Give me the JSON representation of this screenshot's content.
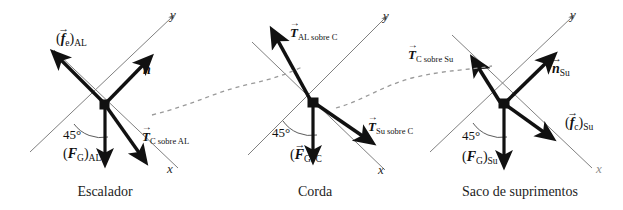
{
  "figure": {
    "kind": "free-body-diagram-set",
    "background_color": "#ffffff",
    "ink_color": "#111111",
    "axis_color": "#6e6e6e",
    "dashed_link_color": "#9a9a9a",
    "angle_value": "45°",
    "axis_x_label": "x",
    "axis_y_label": "y",
    "panels": [
      {
        "id": "escalador",
        "caption": "Escalador",
        "angle": "45°",
        "axis_x": "x",
        "axis_y": "y",
        "vectors": [
          {
            "id": "friction-climber",
            "symbol": "f",
            "arrow": "→",
            "subscript": "e",
            "group_subscript": "AL",
            "parenthesized": true,
            "direction": "up-left"
          },
          {
            "id": "normal-climber",
            "symbol": "n",
            "arrow": "→",
            "subscript": "",
            "group_subscript": "",
            "parenthesized": false,
            "direction": "up-right"
          },
          {
            "id": "tension-rope-on-climber",
            "symbol": "T",
            "arrow": "→",
            "subscript": "C sobre AL",
            "group_subscript": "",
            "parenthesized": false,
            "direction": "down-right"
          },
          {
            "id": "weight-climber",
            "symbol": "F",
            "arrow": "→",
            "subscript": "G",
            "group_subscript": "AL",
            "parenthesized": true,
            "direction": "down"
          }
        ]
      },
      {
        "id": "corda",
        "caption": "Corda",
        "angle": "45°",
        "axis_x": "x",
        "axis_y": "y",
        "vectors": [
          {
            "id": "tension-climber-on-rope",
            "symbol": "T",
            "arrow": "→",
            "subscript": "AL sobre C",
            "group_subscript": "",
            "parenthesized": false,
            "direction": "up-left"
          },
          {
            "id": "tension-bag-on-rope",
            "symbol": "T",
            "arrow": "→",
            "subscript": "Su sobre C",
            "group_subscript": "",
            "parenthesized": false,
            "direction": "down-right"
          },
          {
            "id": "weight-rope",
            "symbol": "F",
            "arrow": "→",
            "subscript": "G",
            "group_subscript": "C",
            "parenthesized": true,
            "direction": "down"
          }
        ]
      },
      {
        "id": "saco-de-suprimentos",
        "caption": "Saco de suprimentos",
        "angle": "45°",
        "axis_x": "x",
        "axis_y": "y",
        "vectors": [
          {
            "id": "tension-rope-on-bag",
            "symbol": "T",
            "arrow": "→",
            "subscript": "C sobre Su",
            "group_subscript": "",
            "parenthesized": false,
            "direction": "up-left"
          },
          {
            "id": "normal-bag",
            "symbol": "n",
            "arrow": "→",
            "subscript": "Su",
            "group_subscript": "",
            "parenthesized": false,
            "direction": "up-right"
          },
          {
            "id": "friction-bag",
            "symbol": "f",
            "arrow": "→",
            "subscript": "c",
            "group_subscript": "Su",
            "parenthesized": true,
            "direction": "down-right"
          },
          {
            "id": "weight-bag",
            "symbol": "F",
            "arrow": "→",
            "subscript": "G",
            "group_subscript": "Su",
            "parenthesized": true,
            "direction": "down"
          }
        ]
      }
    ],
    "labels": {
      "p1_friction": {
        "open": "(",
        "sym": "f",
        "sub": "e",
        "close": ")",
        "group": "AL"
      },
      "p1_normal": {
        "sym": "n"
      },
      "p1_tension": {
        "sym": "T",
        "sub": "C sobre AL"
      },
      "p1_weight": {
        "open": "(",
        "sym": "F",
        "sub": "G",
        "close": ")",
        "group": "AL"
      },
      "p2_tension_up": {
        "sym": "T",
        "sub": "AL sobre C"
      },
      "p2_tension_down": {
        "sym": "T",
        "sub": "Su sobre C"
      },
      "p2_weight": {
        "open": "(",
        "sym": "F",
        "sub": "G",
        "close": ")",
        "group": "C"
      },
      "p3_tension": {
        "sym": "T",
        "sub": "C sobre Su"
      },
      "p3_normal": {
        "sym": "n",
        "sub": "Su"
      },
      "p3_friction": {
        "open": "(",
        "sym": "f",
        "sub": "c",
        "close": ")",
        "group": "Su"
      },
      "p3_weight": {
        "open": "(",
        "sym": "F",
        "sub": "G",
        "close": ")",
        "group": "Su"
      }
    },
    "captions": {
      "one": "Escalador",
      "two": "Corda",
      "three": "Saco de suprimentos"
    },
    "angles": {
      "one": "45°",
      "two": "45°",
      "three": "45°"
    },
    "axes": {
      "p1x": "x",
      "p1y": "y",
      "p2x": "x",
      "p2y": "y",
      "p3x": "x",
      "p3y": "y"
    }
  }
}
